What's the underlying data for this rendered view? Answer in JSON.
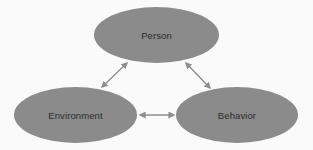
{
  "diagram": {
    "type": "triad",
    "nodes": [
      {
        "id": "person",
        "label": "Person"
      },
      {
        "id": "environment",
        "label": "Environment"
      },
      {
        "id": "behavior",
        "label": "Behavior"
      }
    ],
    "edges": [
      {
        "from": "person",
        "to": "environment",
        "direction": "bidirectional"
      },
      {
        "from": "person",
        "to": "behavior",
        "direction": "bidirectional"
      },
      {
        "from": "environment",
        "to": "behavior",
        "direction": "bidirectional"
      }
    ],
    "colors": {
      "node_fill": "#8b8b8b",
      "label_text": "#2b2b2b",
      "arrow": "#8e8e8e",
      "background": "#fafafa"
    }
  }
}
